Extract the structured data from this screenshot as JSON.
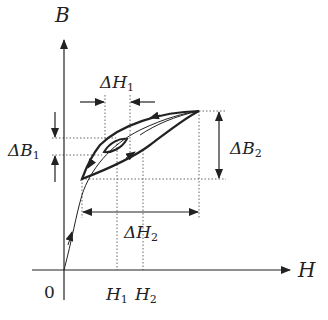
{
  "diagram": {
    "type": "hysteresis-loop",
    "axes": {
      "x_label": "H",
      "y_label": "B",
      "origin_label": "0"
    },
    "tick_labels": {
      "h1": {
        "main": "H",
        "sub": "1"
      },
      "h2": {
        "main": "H",
        "sub": "2"
      }
    },
    "annotations": {
      "delta_h1": {
        "main": "ΔH",
        "sub": "1"
      },
      "delta_h2": {
        "main": "ΔH",
        "sub": "2"
      },
      "delta_b1": {
        "main": "ΔB",
        "sub": "1"
      },
      "delta_b2": {
        "main": "ΔB",
        "sub": "2"
      }
    },
    "colors": {
      "stroke": "#222222",
      "dotted": "#666666",
      "background": "#ffffff"
    }
  }
}
